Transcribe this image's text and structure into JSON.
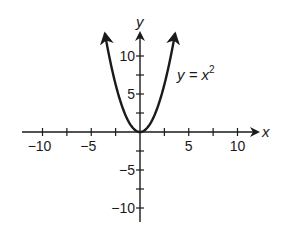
{
  "chart_data": {
    "type": "line",
    "title": "",
    "xlabel": "x",
    "ylabel": "y",
    "xlim": [
      -11,
      11
    ],
    "ylim": [
      -11,
      13
    ],
    "grid": false,
    "legend": null,
    "x_ticks": [
      -10,
      -7.5,
      -5,
      -2.5,
      2.5,
      5,
      7.5,
      10
    ],
    "x_tick_labels": [
      {
        "value": -10,
        "label": "−10"
      },
      {
        "value": -5,
        "label": "−5"
      },
      {
        "value": 5,
        "label": "5"
      },
      {
        "value": 10,
        "label": "10"
      }
    ],
    "y_ticks": [
      -10,
      -7.5,
      -5,
      -2.5,
      2.5,
      5,
      7.5,
      10
    ],
    "y_tick_labels": [
      {
        "value": 10,
        "label": "10"
      },
      {
        "value": 5,
        "label": "5"
      },
      {
        "value": -5,
        "label": "−5"
      },
      {
        "value": -10,
        "label": "−10"
      }
    ],
    "series": [
      {
        "name": "y = x^2",
        "function": "x^2",
        "x_range": [
          -3.6,
          3.6
        ],
        "arrows_at_ends": true,
        "x": [
          -3.6,
          -3,
          -2,
          -1,
          0,
          1,
          2,
          3,
          3.6
        ],
        "y": [
          12.96,
          9,
          4,
          1,
          0,
          1,
          4,
          9,
          12.96
        ]
      }
    ],
    "annotations": [
      {
        "text_prefix": "y = x",
        "superscript": "2",
        "near": {
          "x": 4,
          "y": 8
        }
      }
    ]
  },
  "labels": {
    "x_axis": "x",
    "y_axis": "y",
    "curve_prefix": "y = x",
    "curve_sup": "2"
  },
  "colors": {
    "ink": "#1a1a1a",
    "background": "#ffffff"
  }
}
